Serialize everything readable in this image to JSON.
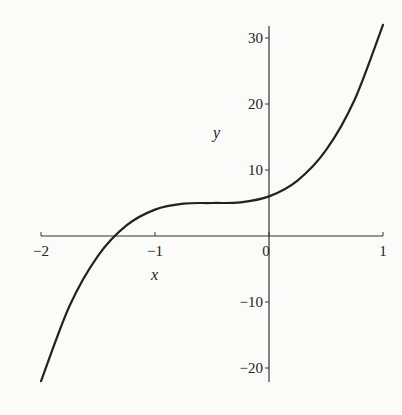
{
  "chart_data": {
    "type": "line",
    "title": "",
    "xlabel": "x",
    "ylabel": "y",
    "xlim": [
      -2,
      1
    ],
    "ylim": [
      -22,
      32
    ],
    "grid": false,
    "legend": null,
    "xticks": [
      "-2",
      "-1",
      "0",
      "1"
    ],
    "yticks": [
      "30",
      "20",
      "10",
      "-10",
      "-20"
    ],
    "series": [
      {
        "name": "curve",
        "x": [
          -2,
          -1.75,
          -1.5,
          -1.25,
          -1,
          -0.75,
          -0.5,
          -0.25,
          0,
          0.25,
          0.5,
          0.75,
          1
        ],
        "values": [
          -22,
          -10.6,
          -3,
          1.6,
          4,
          4.9,
          5,
          5.1,
          6,
          8.4,
          13,
          20.6,
          32
        ]
      }
    ]
  },
  "axes": {
    "x_label": "x",
    "y_label": "y",
    "x_ticks": [
      {
        "label": "−2",
        "value": -2
      },
      {
        "label": "−1",
        "value": -1
      },
      {
        "label": "0",
        "value": 0
      },
      {
        "label": "1",
        "value": 1
      }
    ],
    "y_ticks": [
      {
        "label": "30",
        "value": 30
      },
      {
        "label": "20",
        "value": 20
      },
      {
        "label": "10",
        "value": 10
      },
      {
        "label": "−10",
        "value": -10
      },
      {
        "label": "−20",
        "value": -20
      }
    ]
  }
}
